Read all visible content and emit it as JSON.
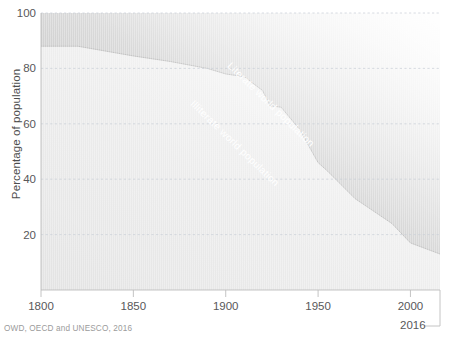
{
  "chart_data": {
    "type": "area",
    "title": "",
    "subtitle": "",
    "xlabel": "",
    "ylabel": "Percentage of population",
    "xlim": [
      1800,
      2016
    ],
    "ylim": [
      0,
      100
    ],
    "grid": true,
    "stacked": true,
    "legend_position": "inline-annotations",
    "xticks": [
      1800,
      1850,
      1900,
      1950,
      2000
    ],
    "xtick_labels": [
      "1800",
      "1850",
      "1900",
      "1950",
      "2000"
    ],
    "end_tick_label": "2016",
    "yticks": [
      20,
      40,
      60,
      80,
      100
    ],
    "ytick_labels": [
      "20",
      "40",
      "60",
      "80",
      "100"
    ],
    "x": [
      1800,
      1820,
      1850,
      1870,
      1890,
      1900,
      1910,
      1920,
      1924,
      1930,
      1940,
      1950,
      1955,
      1970,
      1990,
      2000,
      2010,
      2016
    ],
    "series": [
      {
        "name": "Illiterate world population",
        "values": [
          88,
          88,
          84.5,
          82.5,
          80,
          78,
          77,
          72,
          66.5,
          66,
          58,
          46,
          43,
          33,
          24,
          17,
          14.5,
          13
        ],
        "color": "#e8e8e8"
      },
      {
        "name": "Literate world population",
        "values": [
          12,
          12,
          15.5,
          17.5,
          20,
          22,
          23,
          28,
          33.5,
          34,
          42,
          54,
          57,
          67,
          76,
          83,
          85.5,
          87
        ],
        "color": "#c9c9c9"
      }
    ],
    "annotations": [
      {
        "text": "Literate world population",
        "x": 1906,
        "y": 84,
        "rotation": 44,
        "color": "#ffffff"
      },
      {
        "text": "Illiterate world population",
        "x": 1886,
        "y": 71,
        "rotation": 44,
        "color": "#ffffff"
      }
    ]
  },
  "axis": {
    "y_title": "Percentage of population",
    "y_ticks": [
      {
        "label": "100",
        "value": 100
      },
      {
        "label": "80",
        "value": 80
      },
      {
        "label": "60",
        "value": 60
      },
      {
        "label": "40",
        "value": 40
      },
      {
        "label": "20",
        "value": 20
      }
    ],
    "x_ticks": [
      {
        "label": "1800",
        "value": 1800
      },
      {
        "label": "1850",
        "value": 1850
      },
      {
        "label": "1900",
        "value": 1900
      },
      {
        "label": "1950",
        "value": 1950
      },
      {
        "label": "2000",
        "value": 2000
      }
    ],
    "end_label": "2016"
  },
  "footer": {
    "source": "OWD, OECD and UNESCO, 2016"
  },
  "colors": {
    "background": "#ffffff",
    "illiterate_area": "#e9e9e9",
    "literate_area": "#c6c6c6",
    "gridline": "#cfd4dc",
    "axis_line": "#b9b9b9",
    "tick_text": "#58585a",
    "label_text": "#4d4d4d",
    "source_text": "#9b9b9b",
    "annotation_text": "#ffffff"
  }
}
